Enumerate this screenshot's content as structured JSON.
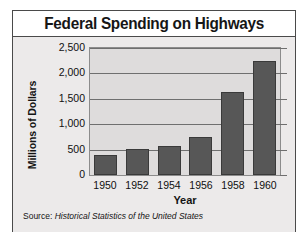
{
  "figure": {
    "title": "Federal Spending on Highways",
    "source_label": "Source:",
    "source_text": "Historical Statistics of the United States",
    "frame_color": "#4a4a4a",
    "body_color": "#eceaea",
    "plot_bg_color": "#dedcdc",
    "bar_color": "#575757"
  },
  "chart_data": {
    "type": "bar",
    "title": "Federal Spending on Highways",
    "xlabel": "Year",
    "ylabel": "Millions of Dollars",
    "categories": [
      "1950",
      "1952",
      "1954",
      "1956",
      "1958",
      "1960"
    ],
    "values": [
      400,
      520,
      580,
      740,
      1640,
      2250
    ],
    "ylim": [
      0,
      2500
    ],
    "ytick_values": [
      0,
      500,
      1000,
      1500,
      2000,
      2500
    ],
    "ytick_labels": [
      "0",
      "500",
      "1,000",
      "1,500",
      "2,000",
      "2,500"
    ],
    "grid": true,
    "legend": false,
    "source": "Source: Historical Statistics of the United States"
  }
}
